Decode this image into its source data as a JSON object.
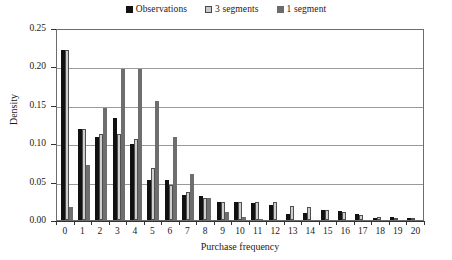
{
  "chart_data": {
    "type": "bar",
    "title": "",
    "xlabel": "Purchase frequency",
    "ylabel": "Density",
    "ylim": [
      0,
      0.25
    ],
    "ytick_labels": [
      "0.25",
      "0.20",
      "0.15",
      "0.10",
      "0.05",
      "0.00"
    ],
    "ytick_values": [
      0.25,
      0.2,
      0.15,
      0.1,
      0.05,
      0.0
    ],
    "grid": "horizontal",
    "legend_position": "top-center",
    "categories": [
      "0",
      "1",
      "2",
      "3",
      "4",
      "5",
      "6",
      "7",
      "8",
      "9",
      "10",
      "11",
      "12",
      "13",
      "14",
      "15",
      "16",
      "17",
      "18",
      "19",
      "20"
    ],
    "series": [
      {
        "name": "Observations",
        "color": "#111111",
        "values": [
          0.222,
          0.119,
          0.108,
          0.133,
          0.099,
          0.052,
          0.052,
          0.032,
          0.031,
          0.023,
          0.023,
          0.022,
          0.02,
          0.008,
          0.009,
          0.013,
          0.012,
          0.008,
          0.003,
          0.004,
          0.002
        ]
      },
      {
        "name": "3 segments",
        "color": "#cfcfcf",
        "values": [
          0.222,
          0.119,
          0.112,
          0.112,
          0.105,
          0.068,
          0.045,
          0.037,
          0.029,
          0.023,
          0.023,
          0.023,
          0.023,
          0.018,
          0.017,
          0.013,
          0.01,
          0.007,
          0.004,
          0.002,
          0.002
        ]
      },
      {
        "name": "1 segment",
        "color": "#6e6e6e",
        "values": [
          0.017,
          0.072,
          0.146,
          0.196,
          0.196,
          0.155,
          0.108,
          0.06,
          0.029,
          0.011,
          0.004,
          0.001,
          0.0,
          0.0,
          0.0,
          0.0,
          0.0,
          0.0,
          0.0,
          0.0,
          0.0
        ]
      }
    ]
  },
  "legend": {
    "entries": [
      {
        "label": "Observations",
        "swatch": "observations-swatch"
      },
      {
        "label": "3 segments",
        "swatch": "three-segments-swatch"
      },
      {
        "label": "1 segment",
        "swatch": "one-segment-swatch"
      }
    ]
  },
  "colors": {
    "observations": "#111111",
    "three_segments": "#cfcfcf",
    "one_segment": "#6e6e6e",
    "gridline": "#9a9a9a",
    "axis": "#333333",
    "plot_border": "#6d6d6d",
    "background": "#ffffff"
  }
}
